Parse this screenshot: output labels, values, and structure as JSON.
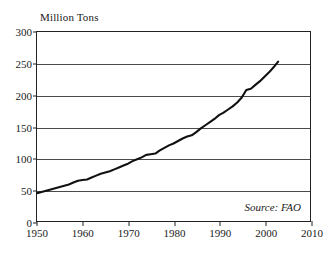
{
  "chart_data": {
    "type": "line",
    "title": "",
    "ylabel": "Million Tons",
    "xlabel": "",
    "ylim": [
      0,
      300
    ],
    "xlim": [
      1950,
      2010
    ],
    "grid": "horizontal",
    "legend": "none",
    "source_note": "Source: FAO",
    "yticks": [
      0,
      50,
      100,
      150,
      200,
      250,
      300
    ],
    "ytick_labels": [
      "0",
      "50",
      "100",
      "150",
      "200",
      "250",
      "300"
    ],
    "xticks": [
      1950,
      1960,
      1970,
      1980,
      1990,
      2000,
      2010
    ],
    "xtick_labels": [
      "1950",
      "1960",
      "1970",
      "1980",
      "1990",
      "2000",
      "2010"
    ],
    "series": [
      {
        "name": "Production",
        "color": "#111111",
        "x": [
          1950,
          1951,
          1952,
          1953,
          1954,
          1955,
          1956,
          1957,
          1958,
          1959,
          1960,
          1961,
          1962,
          1963,
          1964,
          1965,
          1966,
          1967,
          1968,
          1969,
          1970,
          1971,
          1972,
          1973,
          1974,
          1975,
          1976,
          1977,
          1978,
          1979,
          1980,
          1981,
          1982,
          1983,
          1984,
          1985,
          1986,
          1987,
          1988,
          1989,
          1990,
          1991,
          1992,
          1993,
          1994,
          1995,
          1996,
          1997,
          1998,
          1999,
          2000,
          2001,
          2002,
          2003
        ],
        "values": [
          44,
          46,
          48,
          50,
          52,
          54,
          56,
          58,
          61,
          64,
          65,
          66,
          69,
          72,
          75,
          77,
          79,
          82,
          85,
          88,
          91,
          95,
          98,
          101,
          105,
          106,
          107,
          112,
          116,
          120,
          123,
          127,
          131,
          134,
          136,
          141,
          147,
          152,
          157,
          162,
          168,
          172,
          177,
          182,
          188,
          196,
          208,
          210,
          216,
          222,
          229,
          236,
          244,
          253
        ]
      }
    ]
  },
  "axes": {
    "y_caption": "Million Tons",
    "source": "Source: FAO"
  }
}
